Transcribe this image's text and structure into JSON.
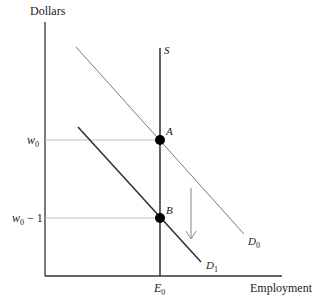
{
  "axes": {
    "y_title": "Dollars",
    "x_title": "Employment"
  },
  "y_ticks": [
    {
      "base": "w",
      "sub": "0",
      "suffix": ""
    },
    {
      "base": "w",
      "sub": "0",
      "suffix": " − 1"
    }
  ],
  "x_ticks": [
    {
      "base": "E",
      "sub": "0"
    }
  ],
  "curves": {
    "supply": {
      "label": "S"
    },
    "demand0": {
      "base": "D",
      "sub": "0"
    },
    "demand1": {
      "base": "D",
      "sub": "1"
    }
  },
  "points": {
    "A": "A",
    "B": "B"
  },
  "colors": {
    "axis": "#333333",
    "supply": "#222222",
    "demand0": "#7a7a7a",
    "demand1": "#333333",
    "guide": "#bdbdbd",
    "arrow": "#8a8a8a",
    "point": "#000000"
  }
}
